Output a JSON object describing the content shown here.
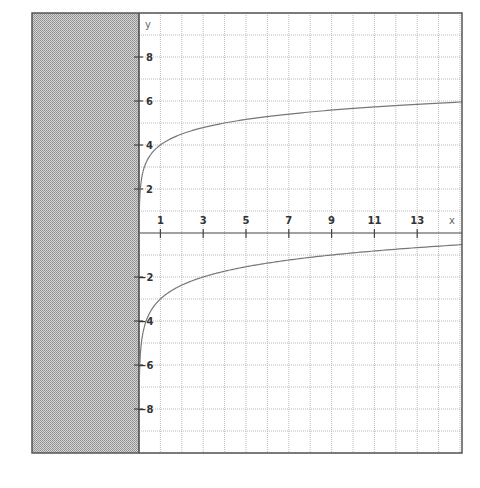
{
  "chart_data": {
    "type": "line",
    "title": "",
    "xlabel": "x",
    "ylabel": "y",
    "xlim": [
      -5,
      15.1
    ],
    "ylim": [
      -10,
      10
    ],
    "grid": true,
    "grid_step": 1,
    "x_ticks": [
      1,
      3,
      5,
      7,
      9,
      11,
      13
    ],
    "y_ticks": [
      8,
      6,
      4,
      2,
      -2,
      -4,
      -6,
      -8
    ],
    "shaded_region": {
      "x_from": -5,
      "x_to": 0,
      "pattern": "gray-dither",
      "description": "Excluded domain x ≤ 0"
    },
    "series": [
      {
        "name": "upper curve",
        "formula": "y = 4 + log4(x)",
        "points": [
          [
            0.06,
            2.0
          ],
          [
            0.25,
            3.0
          ],
          [
            1,
            4.0
          ],
          [
            3,
            4.79
          ],
          [
            5,
            5.16
          ],
          [
            7,
            5.4
          ],
          [
            9,
            5.58
          ],
          [
            11,
            5.73
          ],
          [
            13,
            5.85
          ],
          [
            15,
            5.95
          ]
        ]
      },
      {
        "name": "lower curve",
        "formula": "y = log3(x) - 3",
        "points": [
          [
            0.04,
            -6.0
          ],
          [
            0.11,
            -5.0
          ],
          [
            0.33,
            -4.0
          ],
          [
            1,
            -3.0
          ],
          [
            3,
            -2.0
          ],
          [
            5,
            -1.54
          ],
          [
            7,
            -1.23
          ],
          [
            9,
            -1.0
          ],
          [
            11,
            -0.82
          ],
          [
            13,
            -0.67
          ],
          [
            15,
            -0.54
          ]
        ]
      }
    ]
  },
  "labels": {
    "x_axis": "x",
    "y_axis": "y",
    "x_ticks": [
      "1",
      "3",
      "5",
      "7",
      "9",
      "11",
      "13"
    ],
    "y_ticks": [
      "8",
      "6",
      "4",
      "2",
      "-2",
      "-4",
      "-6",
      "-8"
    ]
  },
  "colors": {
    "frame": "#555555",
    "grid": "#bbbbbb",
    "axis": "#444444",
    "curve": "#777777",
    "shade": "#b8b8b8"
  }
}
